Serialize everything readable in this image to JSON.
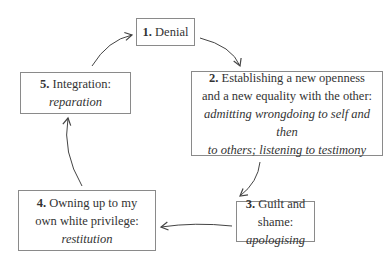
{
  "diagram": {
    "type": "cycle",
    "nodes": [
      {
        "number": "1.",
        "title": "Denial",
        "subtitle": ""
      },
      {
        "number": "2.",
        "title": "Establishing a new openness",
        "title2": "and a new equality with the other:",
        "subtitle": "admitting wrongdoing to self and then",
        "subtitle2": "to others; listening to testimony"
      },
      {
        "number": "3.",
        "title": "Guilt and shame:",
        "subtitle": "apologising"
      },
      {
        "number": "4.",
        "title": "Owning up to my",
        "title2": "own white privilege:",
        "subtitle": "restitution"
      },
      {
        "number": "5.",
        "title": "Integration:",
        "subtitle": "reparation"
      }
    ],
    "edges": [
      [
        "1",
        "2"
      ],
      [
        "2",
        "3"
      ],
      [
        "3",
        "4"
      ],
      [
        "4",
        "5"
      ],
      [
        "5",
        "1"
      ]
    ]
  }
}
